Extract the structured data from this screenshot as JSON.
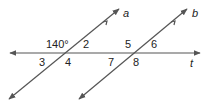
{
  "diagram": {
    "type": "parallel-lines-cut-by-transversal",
    "lines": [
      {
        "id": "a",
        "label": "a"
      },
      {
        "id": "b",
        "label": "b"
      },
      {
        "id": "t",
        "label": "t"
      }
    ],
    "angle_labels": {
      "angle1": "140°",
      "angle2": "2",
      "angle3": "3",
      "angle4": "4",
      "angle5": "5",
      "angle6": "6",
      "angle7": "7",
      "angle8": "8"
    },
    "colors": {
      "line": "#555555",
      "text": "#222222"
    }
  }
}
